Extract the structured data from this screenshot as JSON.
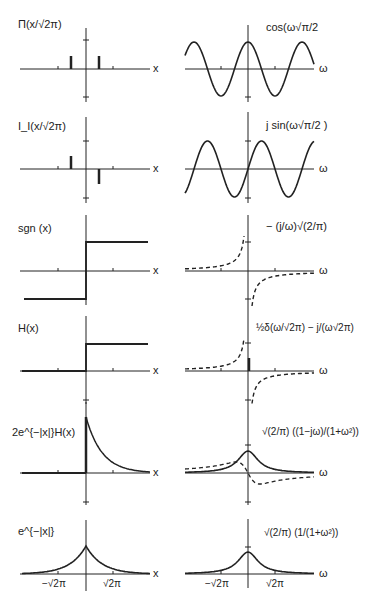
{
  "figure": {
    "axis_labels": {
      "left": "x",
      "right": "ω"
    },
    "ticks": {
      "neg": "−√2π",
      "pos": "√2π"
    },
    "rows": [
      {
        "left_label": "Π(x/√2π)",
        "right_label": "cos(ω√π/2"
      },
      {
        "left_label": "I_I(x/√2π)",
        "right_label": "j sin(ω√π/2 )"
      },
      {
        "left_label": "sgn (x)",
        "right_label": "− (j/ω)√(2/π)"
      },
      {
        "left_label": "H(x)",
        "right_label": "½δ(ω/√2π) − j/(ω√2π)"
      },
      {
        "left_label": "2e^{−|x|}H(x)",
        "right_label": "√(2/π) ((1−jω)/(1+ω²))"
      },
      {
        "left_label": "e^{−|x|}",
        "right_label": "√(2/π) (1/(1+ω²))"
      }
    ]
  },
  "chart_data": [
    {
      "type": "line",
      "title": "Π(x/√2π)",
      "xlabel": "x",
      "series": [
        {
          "name": "impulse pair",
          "x": [
            -1.25,
            1.25
          ],
          "values": [
            1,
            1
          ]
        }
      ]
    },
    {
      "type": "line",
      "title": "cos(ω√π/2)",
      "xlabel": "ω",
      "series": [
        {
          "name": "cos",
          "style": "solid"
        }
      ]
    },
    {
      "type": "line",
      "title": "I_I(x/√2π)",
      "xlabel": "x",
      "series": [
        {
          "name": "odd impulse pair",
          "x": [
            -1.25,
            1.25
          ],
          "values": [
            1,
            -1
          ]
        }
      ]
    },
    {
      "type": "line",
      "title": "j sin(ω√π/2)",
      "xlabel": "ω",
      "series": [
        {
          "name": "sin",
          "style": "solid"
        }
      ]
    },
    {
      "type": "line",
      "title": "sgn(x)",
      "xlabel": "x",
      "series": [
        {
          "name": "sgn",
          "x": [
            -5,
            0,
            0,
            5
          ],
          "values": [
            -1,
            -1,
            1,
            1
          ]
        }
      ]
    },
    {
      "type": "line",
      "title": "−(j/ω)√(2/π)",
      "xlabel": "ω",
      "series": [
        {
          "name": "imag",
          "style": "dashed"
        }
      ]
    },
    {
      "type": "line",
      "title": "H(x)",
      "xlabel": "x",
      "series": [
        {
          "name": "H",
          "x": [
            -5,
            0,
            0,
            5
          ],
          "values": [
            0,
            0,
            1,
            1
          ]
        }
      ]
    },
    {
      "type": "line",
      "title": "½δ(ω/√2π) − j/(ω√2π)",
      "xlabel": "ω",
      "series": [
        {
          "name": "real impulse",
          "style": "solid"
        },
        {
          "name": "imag",
          "style": "dashed"
        }
      ]
    },
    {
      "type": "line",
      "title": "2e^{−|x|}H(x)",
      "xlabel": "x",
      "series": [
        {
          "name": "2e^-x H(x)",
          "style": "solid"
        }
      ]
    },
    {
      "type": "line",
      "title": "√(2/π)(1−jω)/(1+ω²)",
      "xlabel": "ω",
      "series": [
        {
          "name": "real",
          "style": "solid"
        },
        {
          "name": "imag",
          "style": "dashed"
        }
      ]
    },
    {
      "type": "line",
      "title": "e^{−|x|}",
      "xlabel": "x",
      "xticks": [
        "−√2π",
        "√2π"
      ],
      "series": [
        {
          "name": "e^-|x|",
          "style": "solid"
        }
      ]
    },
    {
      "type": "line",
      "title": "√(2/π)/(1+ω²)",
      "xlabel": "ω",
      "xticks": [
        "−√2π",
        "√2π"
      ],
      "series": [
        {
          "name": "Lorentzian",
          "style": "solid"
        }
      ]
    }
  ]
}
